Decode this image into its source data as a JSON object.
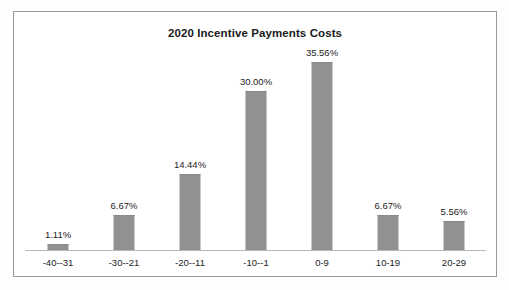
{
  "chart_data": {
    "type": "bar",
    "title": "2020 Incentive Payments Costs",
    "xlabel": "",
    "ylabel": "",
    "grid": false,
    "legend": false,
    "ylim": [
      0,
      38
    ],
    "categories": [
      "-40--31",
      "-30--21",
      "-20--11",
      "-10--1",
      "0-9",
      "10-19",
      "20-29"
    ],
    "values": [
      1.11,
      6.67,
      14.44,
      30.0,
      35.56,
      6.67,
      5.56
    ],
    "data_labels": [
      "1.11%",
      "6.67%",
      "14.44%",
      "30.00%",
      "35.56%",
      "6.67%",
      "5.56%"
    ],
    "series": [
      {
        "name": "Incentive Payments Costs",
        "values": [
          1.11,
          6.67,
          14.44,
          30.0,
          35.56,
          6.67,
          5.56
        ]
      }
    ]
  },
  "style": {
    "bar_color": "#919191",
    "frame_color": "#9a9a9a",
    "axis_color": "#b9b9b9",
    "text_color": "#242424",
    "title_color": "#1a1a1a",
    "background": "#ffffff"
  }
}
